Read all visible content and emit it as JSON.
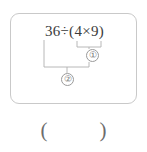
{
  "problem": {
    "expression": {
      "full_text": "36 ÷ (4 × 9)",
      "dividend": "36",
      "divide_sign": "÷",
      "open_paren": "(",
      "factor_a": "4",
      "times_sign": "×",
      "factor_b": "9",
      "close_paren": ")"
    },
    "annotations": {
      "inner_bracket_label": "①",
      "outer_bracket_label": "②",
      "inner_bracket_name": "multiplication-step",
      "outer_bracket_name": "division-step"
    }
  },
  "answer": {
    "open_paren": "(",
    "close_paren": ")",
    "value": ""
  },
  "colors": {
    "card_border": "#c9c9c9",
    "text": "#3b3b3b",
    "annotation": "#9a9a9a",
    "answer_text": "#6d6d6d",
    "page_background": "#ffffff"
  }
}
